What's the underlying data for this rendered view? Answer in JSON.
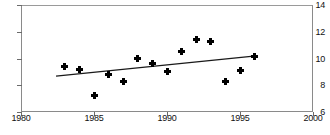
{
  "chart_data": {
    "type": "scatter",
    "title": "",
    "xlabel": "",
    "ylabel": "",
    "xlim": [
      1980,
      2000
    ],
    "ylim": [
      6,
      14
    ],
    "xticks": [
      1980,
      1985,
      1990,
      1995,
      2000
    ],
    "yticks": [
      6,
      8,
      10,
      12,
      14
    ],
    "grid": false,
    "legend": false,
    "marker": "filled-diamond",
    "marker_color": "#000000",
    "x": [
      1983,
      1984,
      1985,
      1986,
      1987,
      1988,
      1989,
      1990,
      1991,
      1992,
      1993,
      1994,
      1995,
      1996
    ],
    "values": [
      9.4,
      9.2,
      7.2,
      8.8,
      8.25,
      10.0,
      9.6,
      9.05,
      10.5,
      11.45,
      11.3,
      8.3,
      9.1,
      10.15
    ],
    "series": [
      {
        "name": "data points",
        "type": "scatter",
        "x": [
          1983,
          1984,
          1985,
          1986,
          1987,
          1988,
          1989,
          1990,
          1991,
          1992,
          1993,
          1994,
          1995,
          1996
        ],
        "values": [
          9.4,
          9.2,
          7.2,
          8.8,
          8.25,
          10.0,
          9.6,
          9.05,
          10.5,
          11.45,
          11.3,
          8.3,
          9.1,
          10.15
        ]
      },
      {
        "name": "linear trend line",
        "type": "line",
        "x": [
          1982.4,
          1996.1
        ],
        "values": [
          8.68,
          10.2
        ],
        "color": "#1a1a1a"
      }
    ]
  },
  "axes": {
    "y_tick_labels": [
      "14",
      "12",
      "10",
      "8",
      "6"
    ],
    "x_tick_labels": [
      "1980",
      "1985",
      "1990",
      "1995",
      "2000"
    ]
  }
}
